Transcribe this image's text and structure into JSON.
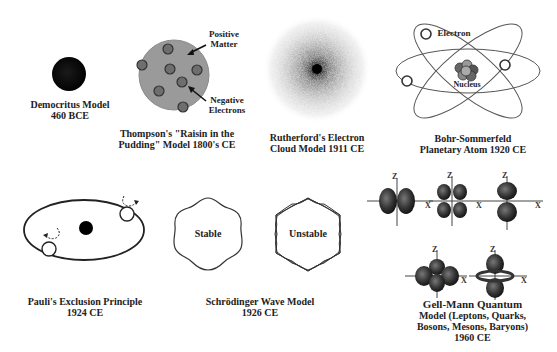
{
  "figure": {
    "models": [
      {
        "id": "democritus",
        "caption_line1": "Democritus Model",
        "caption_line2": "460 BCE"
      },
      {
        "id": "thompson",
        "caption_line1": "Thompson's \"Raisin in the",
        "caption_line2": "Pudding\" Model 1800's CE",
        "labels": {
          "positive_line1": "Positive",
          "positive_line2": "Matter",
          "negative_line1": "Negative",
          "negative_line2": "Electrons"
        }
      },
      {
        "id": "rutherford",
        "caption_line1": "Rutherford's Electron",
        "caption_line2": "Cloud Model 1911 CE"
      },
      {
        "id": "bohr",
        "caption_line1": "Bohr-Sommerfeld",
        "caption_line2": "Planetary Atom 1920 CE",
        "labels": {
          "electron": "Electron",
          "nucleus": "Nucleus"
        }
      },
      {
        "id": "pauli",
        "caption_line1": "Pauli's Exclusion Principle",
        "caption_line2": "1924 CE"
      },
      {
        "id": "schrodinger",
        "caption_line1": "Schrödinger Wave Model",
        "caption_line2": "1926 CE",
        "labels": {
          "stable": "Stable",
          "unstable": "Unstable"
        }
      },
      {
        "id": "gellmann",
        "caption_line1": "Gell-Mann Quantum",
        "caption_line2": "Model (Leptons, Quarks,",
        "caption_line3": "Bosons, Mesons, Baryons)",
        "caption_line4": "1960 CE",
        "axis_labels": {
          "z": "Z",
          "x": "X"
        }
      }
    ]
  }
}
